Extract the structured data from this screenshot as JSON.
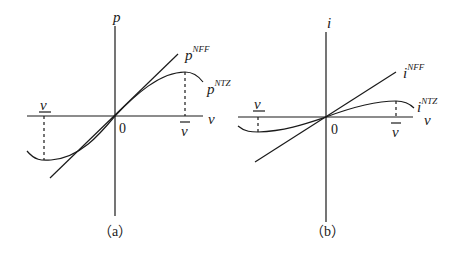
{
  "panels": [
    {
      "caption": "（a）",
      "y_axis_label": "p",
      "x_axis_label": "ν",
      "origin_label": "0",
      "lower_bound_label": "ν",
      "upper_bound_label": "ν",
      "curves": [
        {
          "name": "p",
          "superscript": "NFF",
          "type": "linear"
        },
        {
          "name": "p",
          "superscript": "NTZ",
          "type": "cubic"
        }
      ]
    },
    {
      "caption": "（b）",
      "y_axis_label": "i",
      "x_axis_label": "ν",
      "origin_label": "0",
      "lower_bound_label": "ν",
      "upper_bound_label": "ν",
      "curves": [
        {
          "name": "i",
          "superscript": "NFF",
          "type": "linear"
        },
        {
          "name": "i",
          "superscript": "NTZ",
          "type": "cubic"
        }
      ]
    }
  ],
  "colors": {
    "stroke": "#1a1a1a",
    "background": "#ffffff"
  }
}
